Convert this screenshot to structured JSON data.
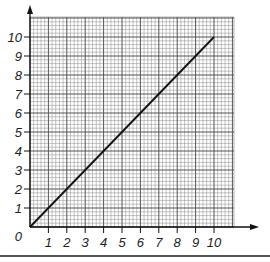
{
  "chart_data": {
    "type": "line",
    "title": "",
    "xlabel": "",
    "ylabel": "",
    "xlim": [
      0,
      11
    ],
    "ylim": [
      0,
      11
    ],
    "grid": true,
    "grid_minor_per_unit": 5,
    "x_ticks": [
      "0",
      "1",
      "2",
      "3",
      "4",
      "5",
      "6",
      "7",
      "8",
      "9",
      "10"
    ],
    "y_ticks": [
      "1",
      "2",
      "3",
      "4",
      "5",
      "6",
      "7",
      "8",
      "9",
      "10"
    ],
    "origin_label": "0",
    "series": [
      {
        "name": "line",
        "x": [
          0,
          10
        ],
        "y": [
          0,
          10
        ],
        "color": "#111111"
      }
    ],
    "legend": null
  },
  "colors": {
    "grid_major": "#555555",
    "grid_minor": "#8a8a8a",
    "axis": "#111111",
    "line": "#111111",
    "background": "#ffffff"
  }
}
